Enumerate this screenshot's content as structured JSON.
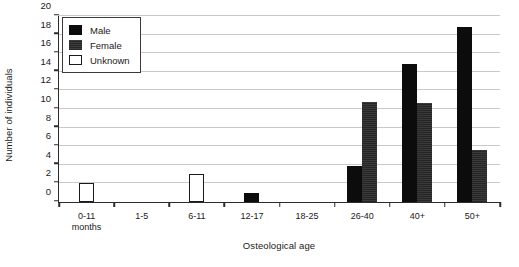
{
  "chart_data": {
    "type": "bar",
    "title": "",
    "xlabel": "Osteological age",
    "ylabel": "Number of individuals",
    "categories": [
      "0-11\nmonths",
      "1-5",
      "6-11",
      "12-17",
      "18-25",
      "26-40",
      "40+",
      "50+"
    ],
    "category_labels": [
      {
        "line1": "0-11",
        "line2": "months"
      },
      {
        "line1": "1-5",
        "line2": ""
      },
      {
        "line1": "6-11",
        "line2": ""
      },
      {
        "line1": "12-17",
        "line2": ""
      },
      {
        "line1": "18-25",
        "line2": ""
      },
      {
        "line1": "26-40",
        "line2": ""
      },
      {
        "line1": "40+",
        "line2": ""
      },
      {
        "line1": "50+",
        "line2": ""
      }
    ],
    "series": [
      {
        "name": "Male",
        "color": "#0c0c0c",
        "values": [
          0,
          0,
          0,
          1,
          0,
          3.8,
          14.8,
          18.7
        ]
      },
      {
        "name": "Female",
        "color": "#303030",
        "values": [
          0,
          0,
          0,
          0,
          0,
          10.7,
          10.6,
          5.6
        ]
      },
      {
        "name": "Unknown",
        "color": "#ffffff",
        "values": [
          2,
          0,
          3,
          0,
          0,
          0,
          0,
          0
        ]
      }
    ],
    "ylim": [
      0,
      20
    ],
    "ytick_step": 2,
    "yticks": [
      0,
      2,
      4,
      6,
      8,
      10,
      12,
      14,
      16,
      18,
      20
    ],
    "grid": true,
    "grid_axis": "y",
    "legend_position": "top-left"
  },
  "legend": {
    "entries": [
      {
        "label": "Male",
        "key": "male"
      },
      {
        "label": "Female",
        "key": "female"
      },
      {
        "label": "Unknown",
        "key": "unknown"
      }
    ]
  }
}
